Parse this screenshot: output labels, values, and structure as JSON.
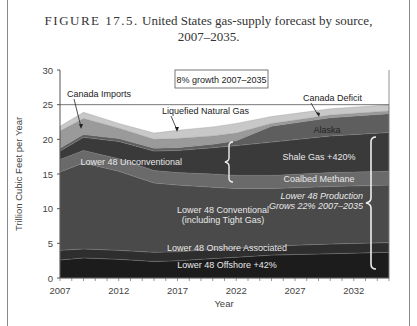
{
  "caption": {
    "figure": "FIGURE 17.5.",
    "line1": "United States gas-supply forecast by source,",
    "line2": "2007–2035."
  },
  "chart_data": {
    "type": "area",
    "stacked": true,
    "title": "United States gas-supply forecast by source, 2007–2035",
    "xlabel": "Year",
    "ylabel": "Trillion Cubic Feet per Year",
    "xlim": [
      2007,
      2035
    ],
    "ylim": [
      0,
      30
    ],
    "xticks": [
      2007,
      2012,
      2017,
      2022,
      2027,
      2032
    ],
    "yticks": [
      0,
      5,
      10,
      15,
      20,
      25,
      30
    ],
    "reference_line": {
      "y": 25
    },
    "annotation_box": "8% growth 2007–2035",
    "x": [
      2007,
      2009,
      2012,
      2015,
      2017,
      2020,
      2022,
      2025,
      2030,
      2035
    ],
    "series": [
      {
        "name": "Lower 48 Offshore +42%",
        "values": [
          2.6,
          2.9,
          2.7,
          2.4,
          2.5,
          2.8,
          3.0,
          3.3,
          3.5,
          3.7
        ]
      },
      {
        "name": "Lower 48 Onshore Associated",
        "values": [
          1.4,
          1.3,
          1.3,
          1.3,
          1.3,
          1.3,
          1.3,
          1.3,
          1.4,
          1.4
        ]
      },
      {
        "name": "Lower 48 Conventional (including Tight Gas)",
        "values": [
          11.3,
          12.4,
          11.4,
          10.0,
          9.6,
          9.0,
          8.6,
          8.3,
          8.3,
          8.3
        ]
      },
      {
        "name": "Coalbed Methane",
        "values": [
          1.8,
          1.8,
          1.8,
          1.8,
          1.8,
          1.9,
          1.9,
          1.9,
          2.0,
          2.0
        ]
      },
      {
        "name": "Shale Gas +420%",
        "values": [
          1.2,
          1.9,
          2.5,
          2.8,
          3.2,
          3.8,
          4.3,
          4.8,
          5.3,
          5.6
        ]
      },
      {
        "name": "Alaska",
        "values": [
          0.4,
          0.4,
          0.4,
          0.4,
          0.4,
          0.5,
          0.7,
          2.3,
          2.6,
          2.7
        ]
      },
      {
        "name": "Canada Imports / Canada Deficit",
        "values": [
          2.5,
          2.3,
          1.5,
          1.3,
          1.3,
          1.2,
          1.1,
          0.4,
          0.4,
          0.4
        ]
      },
      {
        "name": "Liquefied Natural Gas",
        "values": [
          0.7,
          0.9,
          0.7,
          0.9,
          1.2,
          1.3,
          1.4,
          1.0,
          0.9,
          0.9
        ]
      }
    ],
    "annotations": [
      "Canada Imports",
      "Liquefied Natural Gas",
      "Canada Deficit",
      "Alaska",
      "Lower 48 Unconventional",
      "Shale Gas +420%",
      "Coalbed Methane",
      "Lower 48 Production Grows 22% 2007–2035",
      "Lower 48 Conventional (including Tight Gas)",
      "Lower 48 Onshore Associated",
      "Lower 48 Offshore +42%"
    ],
    "colors": [
      "#1c1c1c",
      "#2e2e2e",
      "#4a4a4a",
      "#6a6a6a",
      "#3a3a3a",
      "#5e5e5e",
      "#9a9a9a",
      "#c8c8c8"
    ],
    "grid": false,
    "legend": "none (inline labels)"
  },
  "labels": {
    "box": "8% growth 2007–2035",
    "canada_imports": "Canada Imports",
    "lng": "Liquefied Natural Gas",
    "canada_deficit": "Canada Deficit",
    "alaska": "Alaska",
    "unconventional": "Lower 48 Unconventional",
    "shale": "Shale Gas +420%",
    "coalbed": "Coalbed Methane",
    "production_1": "Lower 48 Production",
    "production_2": "Grows 22% 2007–2035",
    "conventional_1": "Lower 48 Conventional",
    "conventional_2": "(including Tight Gas)",
    "onshore": "Lower 48  Onshore Associated",
    "offshore": "Lower 48  Offshore +42%"
  },
  "axes": {
    "ylabel": "Trillion Cubic Feet per Year",
    "xlabel": "Year",
    "yticks": [
      "0",
      "5",
      "10",
      "15",
      "20",
      "25",
      "30"
    ],
    "xticks": [
      "2007",
      "2012",
      "2017",
      "2022",
      "2027",
      "2032"
    ]
  }
}
